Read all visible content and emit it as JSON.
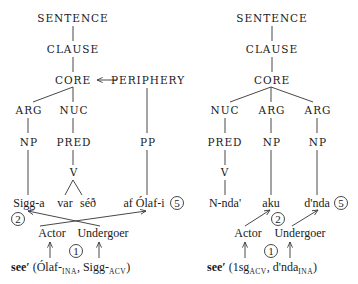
{
  "left_tree": {
    "sentence": "SENTENCE",
    "clause": "CLAUSE",
    "core": "CORE",
    "periphery": "PERIPHERY",
    "arg": "ARG",
    "nuc": "NUC",
    "np": "NP",
    "pred": "PRED",
    "pp": "PP",
    "v": "V",
    "words": {
      "sigga": "Sigg-a",
      "var": "var",
      "sed": "séð",
      "af_olafi": "af Ólaf-i"
    },
    "roles": {
      "actor": "Actor",
      "undergoer": "Undergoer"
    },
    "steps": {
      "one": "1",
      "two": "2",
      "five": "5"
    },
    "formula": {
      "pred": "see′",
      "open": " (Ólaf-",
      "sub1": "INA",
      "mid": ", Sigg-",
      "sub2": "ACV",
      "close": ")"
    }
  },
  "right_tree": {
    "sentence": "SENTENCE",
    "clause": "CLAUSE",
    "core": "CORE",
    "nuc": "NUC",
    "arg1": "ARG",
    "arg2": "ARG",
    "pred": "PRED",
    "np1": "NP",
    "np2": "NP",
    "v": "V",
    "words": {
      "nnda": "N-nda'",
      "aku": "aku",
      "dnda": "d'nda"
    },
    "roles": {
      "actor": "Actor",
      "undergoer": "Undergoer"
    },
    "steps": {
      "one": "1",
      "two": "2",
      "five": "5"
    },
    "formula": {
      "pred": "see′",
      "open": " (1sg",
      "sub1": "ACV",
      "mid": ", d'nda",
      "sub2": "INA",
      "close": ")"
    }
  }
}
